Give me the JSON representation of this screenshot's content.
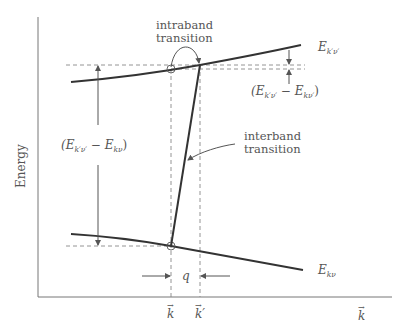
{
  "axes": {
    "y_label": "Energy",
    "x_label": "k"
  },
  "bands": {
    "upper": {
      "label": "E",
      "subscript": "k′ν′"
    },
    "lower": {
      "label": "E",
      "subscript": "kν"
    }
  },
  "annotations": {
    "intraband_line1": "intraband",
    "intraband_line2": "transition",
    "interband_line1": "interband",
    "interband_line2": "transition",
    "big_gap": {
      "open": "(E",
      "sub1": "k′ν′",
      "minus": " − E",
      "sub2": "kν",
      "close": ")"
    },
    "small_gap": {
      "open": "(E",
      "sub1": "k′ν′",
      "minus": " − E",
      "sub2": "kν′",
      "close": ")"
    },
    "momentum": "q"
  },
  "ticks": {
    "k": "k",
    "k_prime": "k′"
  },
  "colors": {
    "curve": "#333333",
    "axis": "#777777",
    "dashed": "#888888",
    "text": "#555555"
  }
}
